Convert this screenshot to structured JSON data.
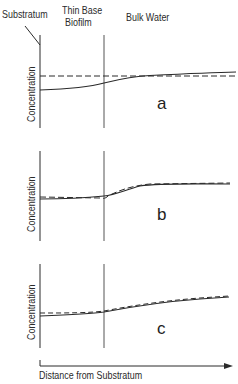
{
  "header": {
    "substratum_label": "Substratum",
    "biofilm_label_line1": "Thin Base",
    "biofilm_label_line2": "Biofilm",
    "bulk_label": "Bulk Water"
  },
  "panels": [
    {
      "letter": "a",
      "ylabel": "Concentration"
    },
    {
      "letter": "b",
      "ylabel": "Concentration"
    },
    {
      "letter": "c",
      "ylabel": "Concentration"
    }
  ],
  "xaxis": {
    "label": "Distance from Substratum"
  },
  "colors": {
    "ink": "#2a2a2a",
    "background": "#ffffff"
  }
}
